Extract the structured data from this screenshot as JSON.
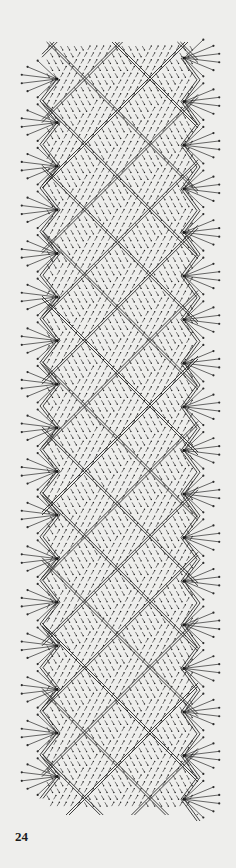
{
  "page": {
    "number": "24",
    "background": "#eeeeec",
    "ink": "#2a2a2a"
  },
  "diagram": {
    "type": "bobbin-lace-pricking",
    "bounds": {
      "top": 42,
      "bottom": 815,
      "left_edge_x": 20,
      "right_edge_x": 215
    },
    "period_px": 43.6,
    "left_fans": {
      "center_x": 57,
      "first_center_y": 79,
      "count": 17,
      "rays": 6,
      "ray_length": 36,
      "zigzag_inner_x": 40
    },
    "right_fans": {
      "center_x": 184,
      "first_center_y": 58,
      "count": 18,
      "rays": 6,
      "ray_length": 36,
      "zigzag_outer_x": 200
    },
    "ground": {
      "pattern": "basket-weave diagonal lattice",
      "cell_size": 21.8,
      "dash_length": 4.5
    }
  }
}
